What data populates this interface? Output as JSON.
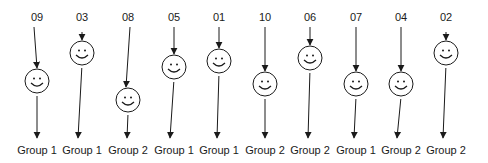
{
  "diagram": {
    "type": "random-assignment",
    "stroke_color": "#1a1a1a",
    "participants": [
      {
        "id": "09",
        "group": "Group 1",
        "x": 37,
        "top_x": 34,
        "cy": 81,
        "tip_x": 37
      },
      {
        "id": "03",
        "group": "Group 1",
        "x": 82,
        "top_x": 82,
        "cy": 53,
        "tip_x": 78
      },
      {
        "id": "08",
        "group": "Group 2",
        "x": 128,
        "top_x": 130,
        "cy": 100,
        "tip_x": 127
      },
      {
        "id": "05",
        "group": "Group 1",
        "x": 174,
        "top_x": 174,
        "cy": 67,
        "tip_x": 170
      },
      {
        "id": "01",
        "group": "Group 1",
        "x": 219,
        "top_x": 219,
        "cy": 61,
        "tip_x": 217
      },
      {
        "id": "10",
        "group": "Group 2",
        "x": 265,
        "top_x": 265,
        "cy": 84,
        "tip_x": 265
      },
      {
        "id": "06",
        "group": "Group 2",
        "x": 310,
        "top_x": 310,
        "cy": 58,
        "tip_x": 308
      },
      {
        "id": "07",
        "group": "Group 1",
        "x": 356,
        "top_x": 356,
        "cy": 84,
        "tip_x": 354
      },
      {
        "id": "04",
        "group": "Group 2",
        "x": 401,
        "top_x": 401,
        "cy": 84,
        "tip_x": 397
      },
      {
        "id": "02",
        "group": "Group 2",
        "x": 446,
        "top_x": 446,
        "cy": 53,
        "tip_x": 443
      }
    ],
    "icon": "smiley-face-icon"
  }
}
